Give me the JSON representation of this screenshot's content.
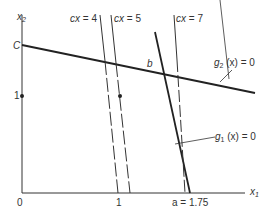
{
  "diagram": {
    "axes": {
      "x_label": "x",
      "x_sub": "1",
      "y_label": "x",
      "y_sub": "2",
      "origin_label": "0",
      "x_tick_1": "1",
      "y_tick_1": "1",
      "y_intercept_label": "C",
      "x_intercept_label": "a = 1.75"
    },
    "constraints": {
      "g1_label": "g",
      "g1_sub": "1",
      "g1_rest": " (x) = 0",
      "g2_label": "g",
      "g2_sub": "2",
      "g2_rest": " (x) = 0"
    },
    "objective_lines": [
      {
        "label": "cx = 4"
      },
      {
        "label": "cx = 5"
      },
      {
        "label": "cx = 7"
      }
    ],
    "point_label": "b",
    "colors": {
      "line": "#222222",
      "text": "#333333"
    }
  }
}
